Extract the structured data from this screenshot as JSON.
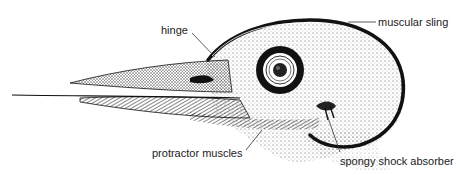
{
  "diagram": {
    "labels": {
      "hinge": "hinge",
      "muscular_sling": "muscular sling",
      "protractor_muscles": "protractor muscles",
      "spongy_shock_absorber": "spongy shock absorber"
    },
    "colors": {
      "ink": "#111111",
      "stipple": "#555555",
      "background": "#ffffff"
    }
  }
}
